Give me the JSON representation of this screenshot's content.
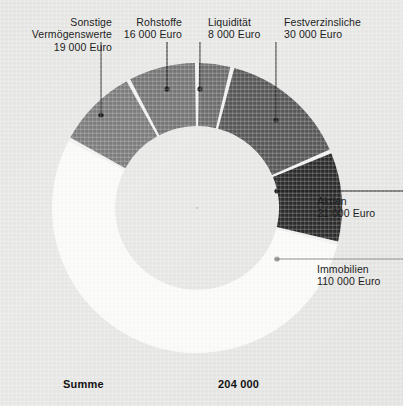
{
  "page": {
    "background_color": "#e7e7e5",
    "text_color": "#1d1d1d"
  },
  "summary": {
    "label": "Summe",
    "value": "204 000"
  },
  "chart_data": {
    "type": "pie",
    "variant": "donut",
    "title": "",
    "total": 204000,
    "unit": "Euro",
    "center": [
      197,
      208
    ],
    "outer_radius": 145,
    "inner_radius": 82,
    "start_angle_deg": -90,
    "direction": "counterclockwise",
    "gap_deg": 1.6,
    "categories": [
      "Rohstoffe",
      "Sonstige Vermögenswerte",
      "Immobilien",
      "Aktien",
      "Festverzinsliche",
      "Liquidität"
    ],
    "values": [
      16000,
      19000,
      110000,
      21000,
      30000,
      8000
    ],
    "segments": [
      {
        "key": "rohstoffe",
        "name": "Rohstoffe",
        "value": 16000,
        "value_text": "16 000 Euro",
        "color": "#767676",
        "percent": 7.8,
        "sweep_deg": 28.2,
        "label_align": "right",
        "label_x": 112,
        "label_y": 22,
        "leader": {
          "type": "vertical",
          "x": 167,
          "y1": 42,
          "y2": 89,
          "dot_x": 167,
          "dot_y": 89,
          "color": "#1d1d1d"
        }
      },
      {
        "key": "sonstige",
        "name": "Sonstige",
        "name2": "Vermögenswerte",
        "value": 19000,
        "value_text": "19 000 Euro",
        "color": "#7d7d7d",
        "percent": 9.3,
        "sweep_deg": 33.5,
        "label_align": "right",
        "label_x": 90,
        "label_y": 22,
        "leader": {
          "type": "vertical",
          "x": 101,
          "y1": 42,
          "y2": 115,
          "dot_x": 101,
          "dot_y": 115,
          "color": "#1d1d1d"
        }
      },
      {
        "key": "immobilien",
        "name": "Immobilien",
        "value": 110000,
        "value_text": "110 000 Euro",
        "color": "#fbfbfa",
        "percent": 53.9,
        "sweep_deg": 194.1,
        "label_align": "left",
        "label_x": 317,
        "label_y": 263,
        "leader": {
          "type": "horizontal",
          "y": 259,
          "x1": 277,
          "x2": 403,
          "dot_x": 277,
          "dot_y": 259,
          "color": "#8e8e8e"
        }
      },
      {
        "key": "aktien",
        "name": "Aktien",
        "value": 21000,
        "value_text": "21 000 Euro",
        "color": "#2b2b2b",
        "percent": 10.3,
        "sweep_deg": 37.1,
        "label_align": "left",
        "label_x": 317,
        "label_y": 196,
        "leader": {
          "type": "horizontal",
          "y": 191,
          "x1": 277,
          "x2": 403,
          "dot_x": 277,
          "dot_y": 191,
          "color": "#1d1d1d"
        }
      },
      {
        "key": "festverzinsliche",
        "name": "Festverzinsliche",
        "value": 30000,
        "value_text": "30 000 Euro",
        "color": "#575757",
        "percent": 14.7,
        "sweep_deg": 52.9,
        "label_align": "left",
        "label_x": 276,
        "label_y": 22,
        "leader": {
          "type": "vertical",
          "x": 276,
          "y1": 42,
          "y2": 120,
          "dot_x": 276,
          "dot_y": 120,
          "color": "#1d1d1d"
        }
      },
      {
        "key": "liquiditaet",
        "name": "Liquidität",
        "value": 8000,
        "value_text": "8 000 Euro",
        "color": "#6d6d6d",
        "percent": 3.9,
        "sweep_deg": 14.1,
        "label_align": "left",
        "label_x": 208,
        "label_y": 22,
        "leader": {
          "type": "vertical",
          "x": 200,
          "y1": 42,
          "y2": 89,
          "dot_x": 200,
          "dot_y": 89,
          "color": "#1d1d1d"
        }
      }
    ]
  }
}
